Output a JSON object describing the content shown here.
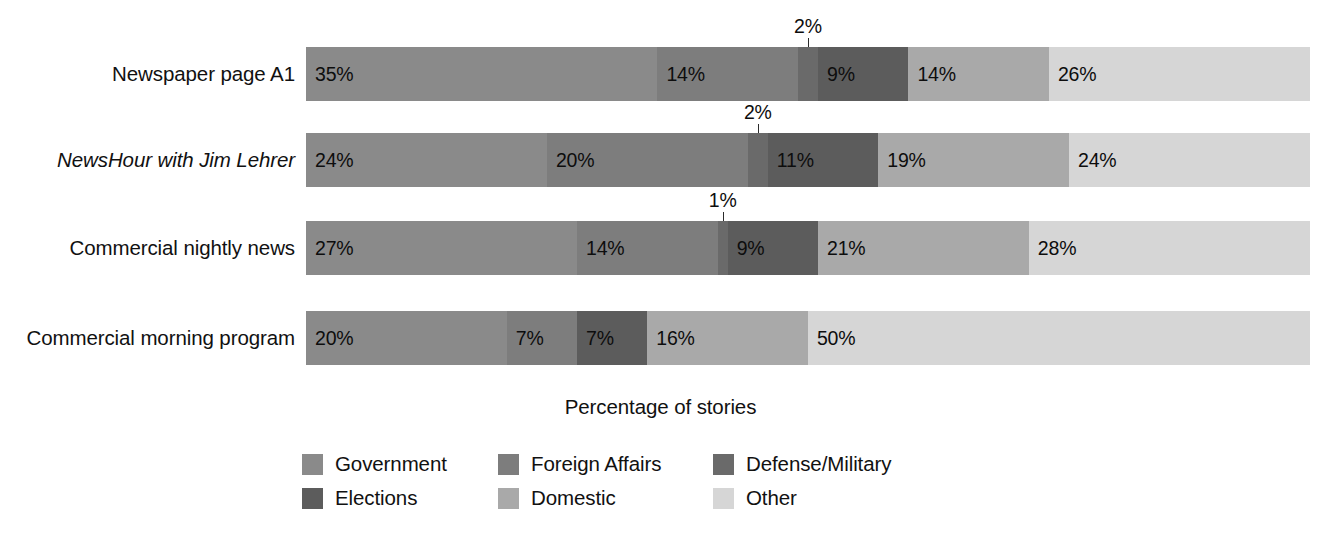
{
  "chart_data": {
    "type": "bar",
    "subtype": "horizontal-stacked-100-percent",
    "title": "",
    "xlabel": "Percentage of stories",
    "ylabel": "",
    "xlim": [
      0,
      100
    ],
    "grid": false,
    "legend_position": "bottom",
    "value_suffix": "%",
    "categories": [
      "Newspaper page A1",
      "NewsHour with Jim Lehrer",
      "Commercial nightly news",
      "Commercial morning program"
    ],
    "series": [
      {
        "name": "Government",
        "color": "#8a8a8a",
        "values": [
          35,
          24,
          27,
          20
        ]
      },
      {
        "name": "Foreign Affairs",
        "color": "#7d7d7d",
        "values": [
          14,
          20,
          14,
          7
        ]
      },
      {
        "name": "Defense/Military",
        "color": "#6a6a6a",
        "values": [
          2,
          2,
          1,
          0
        ]
      },
      {
        "name": "Elections",
        "color": "#5c5c5c",
        "values": [
          9,
          11,
          9,
          7
        ]
      },
      {
        "name": "Domestic",
        "color": "#a9a9a9",
        "values": [
          14,
          19,
          21,
          16
        ]
      },
      {
        "name": "Other",
        "color": "#d6d6d6",
        "values": [
          26,
          24,
          28,
          50
        ]
      }
    ]
  },
  "rows": [
    {
      "label": "Newspaper page A1",
      "italic": false,
      "segments": [
        {
          "series": "Government",
          "value": 35,
          "label": "35%",
          "color": "#8a8a8a",
          "callout": false
        },
        {
          "series": "Foreign Affairs",
          "value": 14,
          "label": "14%",
          "color": "#7d7d7d",
          "callout": false
        },
        {
          "series": "Defense/Military",
          "value": 2,
          "label": "2%",
          "color": "#6a6a6a",
          "callout": true
        },
        {
          "series": "Elections",
          "value": 9,
          "label": "9%",
          "color": "#5c5c5c",
          "callout": false
        },
        {
          "series": "Domestic",
          "value": 14,
          "label": "14%",
          "color": "#a9a9a9",
          "callout": false
        },
        {
          "series": "Other",
          "value": 26,
          "label": "26%",
          "color": "#d6d6d6",
          "callout": false
        }
      ]
    },
    {
      "label": "NewsHour with Jim Lehrer",
      "italic": true,
      "segments": [
        {
          "series": "Government",
          "value": 24,
          "label": "24%",
          "color": "#8a8a8a",
          "callout": false
        },
        {
          "series": "Foreign Affairs",
          "value": 20,
          "label": "20%",
          "color": "#7d7d7d",
          "callout": false
        },
        {
          "series": "Defense/Military",
          "value": 2,
          "label": "2%",
          "color": "#6a6a6a",
          "callout": true
        },
        {
          "series": "Elections",
          "value": 11,
          "label": "11%",
          "color": "#5c5c5c",
          "callout": false
        },
        {
          "series": "Domestic",
          "value": 19,
          "label": "19%",
          "color": "#a9a9a9",
          "callout": false
        },
        {
          "series": "Other",
          "value": 24,
          "label": "24%",
          "color": "#d6d6d6",
          "callout": false
        }
      ]
    },
    {
      "label": "Commercial nightly news",
      "italic": false,
      "segments": [
        {
          "series": "Government",
          "value": 27,
          "label": "27%",
          "color": "#8a8a8a",
          "callout": false
        },
        {
          "series": "Foreign Affairs",
          "value": 14,
          "label": "14%",
          "color": "#7d7d7d",
          "callout": false
        },
        {
          "series": "Defense/Military",
          "value": 1,
          "label": "1%",
          "color": "#6a6a6a",
          "callout": true
        },
        {
          "series": "Elections",
          "value": 9,
          "label": "9%",
          "color": "#5c5c5c",
          "callout": false
        },
        {
          "series": "Domestic",
          "value": 21,
          "label": "21%",
          "color": "#a9a9a9",
          "callout": false
        },
        {
          "series": "Other",
          "value": 28,
          "label": "28%",
          "color": "#d6d6d6",
          "callout": false
        }
      ]
    },
    {
      "label": "Commercial morning program",
      "italic": false,
      "segments": [
        {
          "series": "Government",
          "value": 20,
          "label": "20%",
          "color": "#8a8a8a",
          "callout": false
        },
        {
          "series": "Foreign Affairs",
          "value": 7,
          "label": "7%",
          "color": "#7d7d7d",
          "callout": false
        },
        {
          "series": "Defense/Military",
          "value": 0,
          "label": "",
          "color": "#6a6a6a",
          "callout": false
        },
        {
          "series": "Elections",
          "value": 7,
          "label": "7%",
          "color": "#5c5c5c",
          "callout": false
        },
        {
          "series": "Domestic",
          "value": 16,
          "label": "16%",
          "color": "#a9a9a9",
          "callout": false
        },
        {
          "series": "Other",
          "value": 50,
          "label": "50%",
          "color": "#d6d6d6",
          "callout": false
        }
      ]
    }
  ],
  "axis_caption": "Percentage of stories",
  "legend": {
    "items": [
      {
        "label": "Government",
        "color": "#8a8a8a"
      },
      {
        "label": "Foreign Affairs",
        "color": "#7d7d7d"
      },
      {
        "label": "Defense/Military",
        "color": "#6a6a6a"
      },
      {
        "label": "Elections",
        "color": "#5c5c5c"
      },
      {
        "label": "Domestic",
        "color": "#a9a9a9"
      },
      {
        "label": "Other",
        "color": "#d6d6d6"
      }
    ],
    "order": [
      "Government",
      "Foreign Affairs",
      "Defense/Military",
      "Elections",
      "Domestic",
      "Other"
    ]
  }
}
